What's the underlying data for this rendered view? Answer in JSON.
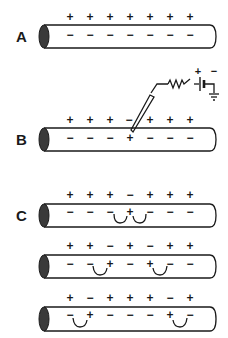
{
  "panels": [
    {
      "label": "A",
      "outer": [
        "+",
        "+",
        "+",
        "+",
        "+",
        "+",
        "+"
      ],
      "inner": [
        "−",
        "−",
        "−",
        "−",
        "−",
        "−",
        "−"
      ],
      "currents": []
    },
    {
      "label": "B",
      "outer": [
        "+",
        "+",
        "+",
        "−",
        "+",
        "+",
        "+"
      ],
      "inner": [
        "−",
        "−",
        "−",
        "+",
        "−",
        "−",
        "−"
      ],
      "currents": []
    },
    {
      "label": "C",
      "outer": [
        "+",
        "+",
        "+",
        "−",
        "+",
        "+",
        "+"
      ],
      "inner": [
        "−",
        "−",
        "−",
        "+",
        "−",
        "−",
        "−"
      ],
      "currents": [
        "local-current-left",
        "local-current-right"
      ]
    },
    {
      "label": "",
      "outer": [
        "+",
        "+",
        "−",
        "+",
        "−",
        "+",
        "+"
      ],
      "inner": [
        "−",
        "−",
        "+",
        "−",
        "+",
        "−",
        "−"
      ],
      "currents": [
        "local-current-left",
        "local-current-right"
      ]
    },
    {
      "label": "",
      "outer": [
        "+",
        "−",
        "+",
        "+",
        "+",
        "−",
        "+"
      ],
      "inner": [
        "−",
        "+",
        "−",
        "−",
        "−",
        "+",
        "−"
      ],
      "currents": [
        "local-current-left",
        "local-current-right"
      ]
    }
  ],
  "stimulator": {
    "battery_plus": "+",
    "battery_minus": "−",
    "components": [
      "microelectrode",
      "resistor",
      "battery",
      "ground"
    ]
  },
  "colors": {
    "ink": "#1a1a1a",
    "axon_end": "#3a3a3a",
    "background": "#ffffff"
  }
}
